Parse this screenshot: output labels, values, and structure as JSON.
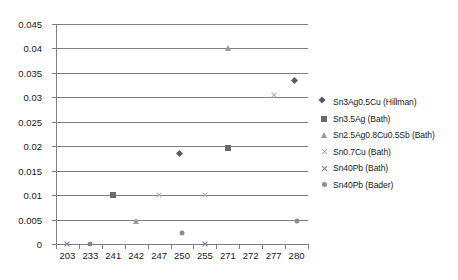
{
  "chart_data": {
    "type": "scatter",
    "title": "",
    "xlabel": "",
    "ylabel": "",
    "grid": true,
    "legend_position": "right",
    "categories": [
      "203",
      "233",
      "241",
      "242",
      "247",
      "250",
      "255",
      "271",
      "272",
      "277",
      "280"
    ],
    "ylim": [
      0,
      0.045
    ],
    "ytick_labels": [
      "0",
      "0.005",
      "0.01",
      "0.015",
      "0.02",
      "0.025",
      "0.03",
      "0.035",
      "0.04",
      "0.045"
    ],
    "ytick_values": [
      0,
      0.005,
      0.01,
      0.015,
      0.02,
      0.025,
      0.03,
      0.035,
      0.04,
      0.045
    ],
    "series": [
      {
        "name": "Sn3Ag0.5Cu (Hillman)",
        "marker": "diamond",
        "color": "#5a5a6e",
        "points": [
          {
            "x": "250",
            "y": 0.018
          },
          {
            "x": "280",
            "y": 0.033
          }
        ]
      },
      {
        "name": "Sn3.5Ag (Bath)",
        "marker": "square",
        "color": "#6b6b6b",
        "points": [
          {
            "x": "241",
            "y": 0.01
          },
          {
            "x": "271",
            "y": 0.0197
          }
        ]
      },
      {
        "name": "Sn2.5Ag0.8Cu0.5Sb (Bath)",
        "marker": "triangle",
        "color": "#9a9aa6",
        "points": [
          {
            "x": "242",
            "y": 0.0048
          },
          {
            "x": "271",
            "y": 0.04
          }
        ]
      },
      {
        "name": "Sn0.7Cu (Bath)",
        "marker": "cross-light",
        "color": "#b0b0bb",
        "points": [
          {
            "x": "247",
            "y": 0.01
          },
          {
            "x": "255",
            "y": 0.01
          },
          {
            "x": "277",
            "y": 0.0305
          }
        ]
      },
      {
        "name": "Sn40Pb (Bath)",
        "marker": "cross-dark",
        "color": "#7a7a88",
        "points": [
          {
            "x": "203",
            "y": 0
          },
          {
            "x": "255",
            "y": 0
          }
        ]
      },
      {
        "name": "Sn40Pb (Bader)",
        "marker": "circle",
        "color": "#8c8c99",
        "points": [
          {
            "x": "233",
            "y": 0
          },
          {
            "x": "250",
            "y": 0.0022
          },
          {
            "x": "280",
            "y": 0.0048
          }
        ]
      }
    ]
  }
}
